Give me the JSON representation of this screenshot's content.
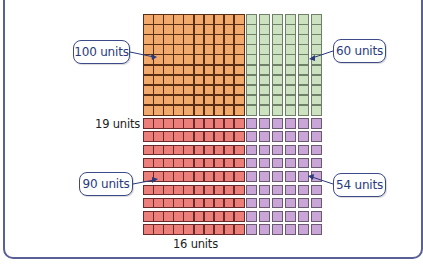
{
  "diagram": {
    "dimensions": {
      "vertical_label": "19 units",
      "horizontal_label": "16 units"
    },
    "regions": [
      {
        "id": "top-left",
        "label": "100 units",
        "rows": 10,
        "cols": 10,
        "color": "#f2a96c",
        "line": "#5a2e14"
      },
      {
        "id": "top-right",
        "label": "60 units",
        "rows": 10,
        "cols": 6,
        "color": "#cde2c0",
        "line": "#6f8068"
      },
      {
        "id": "bottom-left",
        "label": "90 units",
        "rows": 9,
        "cols": 10,
        "color": "#ec7f7a",
        "line": "#6b2a2a"
      },
      {
        "id": "bottom-right",
        "label": "54 units",
        "rows": 9,
        "cols": 6,
        "color": "#c9a5d8",
        "line": "#6a5a70"
      }
    ],
    "callout_color": "#2a3a7c",
    "panel_border": "#5a5f96"
  }
}
